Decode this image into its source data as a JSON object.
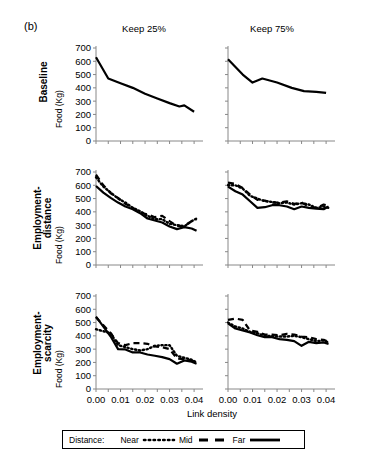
{
  "figure": {
    "panel_label": "(b)",
    "column_headers": [
      "Keep 25%",
      "Keep 75%"
    ],
    "row_headers": [
      "Baseline",
      "Employment-\ndistance",
      "Employment-\nscarcity"
    ],
    "y_axis_label": "Food (Kg)",
    "x_axis_title": "Link density",
    "legend": {
      "title": "Distance:",
      "entries": [
        {
          "label": "Near",
          "style": "dotted"
        },
        {
          "label": "Mid",
          "style": "dashed"
        },
        {
          "label": "Far",
          "style": "solid"
        }
      ]
    }
  },
  "chart_data": [
    {
      "type": "line",
      "id": "baseline-keep25",
      "title": "Keep 25%",
      "row": "Baseline",
      "xlabel": "Link density",
      "ylabel": "Food (Kg)",
      "xlim": [
        0.0,
        0.042
      ],
      "ylim": [
        0,
        700
      ],
      "yticks": [
        0,
        100,
        200,
        300,
        400,
        500,
        600,
        700
      ],
      "xticks": [
        0.0,
        0.01,
        0.02,
        0.03,
        0.04
      ],
      "grid": false,
      "series": [
        {
          "name": "Far",
          "style": "solid",
          "x": [
            0.0,
            0.005,
            0.01,
            0.015,
            0.02,
            0.025,
            0.03,
            0.034,
            0.036,
            0.04
          ],
          "values": [
            630,
            470,
            435,
            400,
            355,
            320,
            285,
            260,
            268,
            220
          ]
        }
      ]
    },
    {
      "type": "line",
      "id": "baseline-keep75",
      "title": "Keep 75%",
      "row": "Baseline",
      "xlabel": "Link density",
      "ylabel": "Food (Kg)",
      "xlim": [
        0.0,
        0.042
      ],
      "ylim": [
        0,
        700
      ],
      "yticks": [
        0,
        100,
        200,
        300,
        400,
        500,
        600,
        700
      ],
      "xticks": [
        0.0,
        0.01,
        0.02,
        0.03,
        0.04
      ],
      "grid": false,
      "series": [
        {
          "name": "Far",
          "style": "solid",
          "x": [
            0.0,
            0.006,
            0.01,
            0.014,
            0.02,
            0.026,
            0.031,
            0.036,
            0.04
          ],
          "values": [
            615,
            500,
            440,
            470,
            440,
            400,
            375,
            370,
            362
          ]
        }
      ]
    },
    {
      "type": "line",
      "id": "employment-distance-keep25",
      "title": "Keep 25%",
      "row": "Employment-distance",
      "xlabel": "Link density",
      "ylabel": "Food (Kg)",
      "xlim": [
        0.0,
        0.042
      ],
      "ylim": [
        0,
        700
      ],
      "yticks": [
        0,
        100,
        200,
        300,
        400,
        500,
        600,
        700
      ],
      "xticks": [
        0.0,
        0.01,
        0.02,
        0.03,
        0.04
      ],
      "grid": false,
      "series": [
        {
          "name": "Near",
          "style": "dotted",
          "x": [
            0.0,
            0.003,
            0.006,
            0.009,
            0.012,
            0.015,
            0.018,
            0.021,
            0.024,
            0.027,
            0.03,
            0.033,
            0.036,
            0.039,
            0.041
          ],
          "values": [
            660,
            590,
            545,
            500,
            470,
            430,
            405,
            370,
            345,
            345,
            310,
            300,
            290,
            330,
            350
          ]
        },
        {
          "name": "Mid",
          "style": "dashed",
          "x": [
            0.0,
            0.003,
            0.006,
            0.009,
            0.012,
            0.015,
            0.018,
            0.021,
            0.024,
            0.027,
            0.03,
            0.033,
            0.036,
            0.039,
            0.041
          ],
          "values": [
            680,
            600,
            540,
            505,
            460,
            430,
            395,
            380,
            360,
            370,
            330,
            295,
            295,
            330,
            345
          ]
        },
        {
          "name": "Far",
          "style": "solid",
          "x": [
            0.0,
            0.003,
            0.006,
            0.009,
            0.012,
            0.015,
            0.018,
            0.021,
            0.024,
            0.027,
            0.03,
            0.033,
            0.036,
            0.039,
            0.041
          ],
          "values": [
            595,
            545,
            505,
            470,
            440,
            420,
            390,
            350,
            335,
            320,
            290,
            270,
            285,
            275,
            258
          ]
        }
      ]
    },
    {
      "type": "line",
      "id": "employment-distance-keep75",
      "title": "Keep 75%",
      "row": "Employment-distance",
      "xlabel": "Link density",
      "ylabel": "Food (Kg)",
      "xlim": [
        0.0,
        0.042
      ],
      "ylim": [
        0,
        700
      ],
      "yticks": [
        0,
        100,
        200,
        300,
        400,
        500,
        600,
        700
      ],
      "xticks": [
        0.0,
        0.01,
        0.02,
        0.03,
        0.04
      ],
      "grid": false,
      "series": [
        {
          "name": "Near",
          "style": "dotted",
          "x": [
            0.0,
            0.003,
            0.006,
            0.009,
            0.012,
            0.015,
            0.018,
            0.021,
            0.024,
            0.027,
            0.03,
            0.033,
            0.036,
            0.039,
            0.041
          ],
          "values": [
            600,
            600,
            575,
            520,
            500,
            480,
            475,
            465,
            470,
            455,
            465,
            455,
            430,
            440,
            430
          ]
        },
        {
          "name": "Mid",
          "style": "dashed",
          "x": [
            0.0,
            0.003,
            0.006,
            0.009,
            0.012,
            0.015,
            0.018,
            0.021,
            0.024,
            0.027,
            0.03,
            0.033,
            0.036,
            0.039,
            0.041
          ],
          "values": [
            620,
            610,
            580,
            530,
            490,
            485,
            470,
            470,
            480,
            460,
            470,
            440,
            430,
            455,
            445
          ]
        },
        {
          "name": "Far",
          "style": "solid",
          "x": [
            0.0,
            0.003,
            0.006,
            0.009,
            0.012,
            0.015,
            0.018,
            0.021,
            0.024,
            0.027,
            0.03,
            0.033,
            0.036,
            0.039,
            0.041
          ],
          "values": [
            590,
            555,
            530,
            480,
            430,
            435,
            450,
            450,
            440,
            420,
            440,
            430,
            425,
            420,
            440
          ]
        }
      ]
    },
    {
      "type": "line",
      "id": "employment-scarcity-keep25",
      "title": "Keep 25%",
      "row": "Employment-scarcity",
      "xlabel": "Link density",
      "ylabel": "Food (Kg)",
      "xlim": [
        0.0,
        0.042
      ],
      "ylim": [
        0,
        700
      ],
      "yticks": [
        0,
        100,
        200,
        300,
        400,
        500,
        600,
        700
      ],
      "xticks": [
        0.0,
        0.01,
        0.02,
        0.03,
        0.04
      ],
      "grid": false,
      "series": [
        {
          "name": "Near",
          "style": "dotted",
          "x": [
            0.0,
            0.003,
            0.006,
            0.009,
            0.012,
            0.015,
            0.018,
            0.021,
            0.024,
            0.027,
            0.03,
            0.033,
            0.036,
            0.039,
            0.041
          ],
          "values": [
            450,
            435,
            420,
            330,
            315,
            300,
            290,
            300,
            325,
            330,
            330,
            250,
            235,
            220,
            200
          ]
        },
        {
          "name": "Mid",
          "style": "dashed",
          "x": [
            0.0,
            0.003,
            0.006,
            0.009,
            0.012,
            0.015,
            0.018,
            0.021,
            0.024,
            0.027,
            0.03,
            0.033,
            0.036,
            0.039,
            0.041
          ],
          "values": [
            540,
            480,
            420,
            345,
            330,
            345,
            345,
            340,
            320,
            315,
            300,
            230,
            225,
            215,
            195
          ]
        },
        {
          "name": "Far",
          "style": "solid",
          "x": [
            0.0,
            0.003,
            0.006,
            0.009,
            0.012,
            0.015,
            0.018,
            0.021,
            0.024,
            0.027,
            0.03,
            0.033,
            0.036,
            0.039,
            0.041
          ],
          "values": [
            545,
            470,
            395,
            300,
            298,
            275,
            275,
            260,
            250,
            240,
            225,
            190,
            215,
            205,
            190
          ]
        }
      ]
    },
    {
      "type": "line",
      "id": "employment-scarcity-keep75",
      "title": "Keep 75%",
      "row": "Employment-scarcity",
      "xlabel": "Link density",
      "ylabel": "Food (Kg)",
      "xlim": [
        0.0,
        0.042
      ],
      "ylim": [
        0,
        700
      ],
      "yticks": [
        0,
        100,
        200,
        300,
        400,
        500,
        600,
        700
      ],
      "xticks": [
        0.0,
        0.01,
        0.02,
        0.03,
        0.04
      ],
      "grid": false,
      "series": [
        {
          "name": "Near",
          "style": "dotted",
          "x": [
            0.0,
            0.003,
            0.006,
            0.009,
            0.012,
            0.015,
            0.018,
            0.021,
            0.024,
            0.027,
            0.03,
            0.033,
            0.036,
            0.039,
            0.041
          ],
          "values": [
            500,
            470,
            455,
            430,
            420,
            400,
            400,
            395,
            395,
            400,
            390,
            375,
            360,
            365,
            350
          ]
        },
        {
          "name": "Mid",
          "style": "dashed",
          "x": [
            0.0,
            0.003,
            0.006,
            0.009,
            0.012,
            0.015,
            0.018,
            0.021,
            0.024,
            0.027,
            0.03,
            0.033,
            0.036,
            0.039,
            0.041
          ],
          "values": [
            520,
            530,
            520,
            440,
            430,
            410,
            410,
            405,
            415,
            410,
            395,
            390,
            375,
            370,
            355
          ]
        },
        {
          "name": "Far",
          "style": "solid",
          "x": [
            0.0,
            0.003,
            0.006,
            0.009,
            0.012,
            0.015,
            0.018,
            0.021,
            0.024,
            0.027,
            0.03,
            0.033,
            0.036,
            0.039,
            0.041
          ],
          "values": [
            495,
            455,
            440,
            425,
            405,
            390,
            390,
            375,
            370,
            360,
            325,
            355,
            345,
            350,
            340
          ]
        }
      ]
    }
  ]
}
